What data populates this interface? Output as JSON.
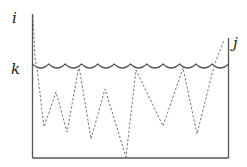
{
  "diagram": {
    "type": "bounded-region-with-scalloped-boundary",
    "labels": {
      "top_left": "i",
      "middle_left": "k",
      "top_right": "j"
    },
    "colors": {
      "walls": "#555555",
      "scallop_line": "#555555",
      "dashed_path": "#777777",
      "label_text": "#222222",
      "background": "#ffffff"
    },
    "elements": {
      "left_wall": "vertical line from i down to the floor",
      "right_wall": "vertical line from j down to the floor",
      "floor": "horizontal base line",
      "scalloped_line": "horizontal row of arcs at level k",
      "dashed_path": "zig-zag dotted trajectory inside the box"
    },
    "scallop_count": 12
  }
}
